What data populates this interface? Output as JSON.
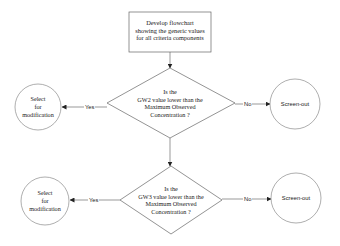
{
  "flowchart": {
    "start_box": {
      "lines": [
        "Develop flowchart",
        "showing the generic values",
        "for all criteria components"
      ]
    },
    "decision_1": {
      "lines": [
        "Is the",
        "GW2 value  lower than the",
        "Maximum Observed",
        "Concentration ?"
      ],
      "yes_label": "Yes",
      "no_label": "No",
      "yes_target": {
        "lines": [
          "Select",
          "for",
          "modification"
        ]
      },
      "no_target": {
        "label": "Screen-out"
      }
    },
    "decision_2": {
      "lines": [
        "Is the",
        "GW3 value lower than the",
        "Maximum Observed",
        "Concentration ?"
      ],
      "yes_label": "Yes",
      "no_label": "No",
      "yes_target": {
        "lines": [
          "Select",
          "for",
          "modification"
        ]
      },
      "no_target": {
        "label": "Screen-out"
      }
    }
  },
  "colors": {
    "stroke": "#555555",
    "background": "#ffffff",
    "text": "#1a1a1a"
  }
}
